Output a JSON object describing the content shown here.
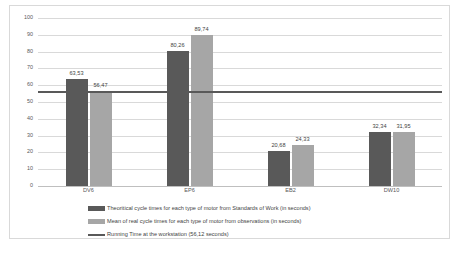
{
  "chart_data": {
    "type": "bar",
    "title": "",
    "xlabel": "",
    "ylabel": "",
    "ylim": [
      0,
      100
    ],
    "ytick_step": 10,
    "yticks": [
      "0",
      "10",
      "20",
      "30",
      "40",
      "50",
      "60",
      "70",
      "80",
      "90",
      "100"
    ],
    "grid": true,
    "legend_position": "bottom",
    "categories": [
      "DV6",
      "EP6",
      "EB2",
      "DW10"
    ],
    "series": [
      {
        "name": "Theoritical cycle times for each type of motor from Standards of Work (in seconds)",
        "color": "#595959",
        "values": [
          63.53,
          80.26,
          20.68,
          32.34
        ],
        "labels": [
          "63,53",
          "80,26",
          "20,68",
          "32,34"
        ]
      },
      {
        "name": "Mean of real cycle times for each type of motor from observations (in seconds)",
        "color": "#a6a6a6",
        "values": [
          56.47,
          89.74,
          24.33,
          31.95
        ],
        "labels": [
          "56,47",
          "89,74",
          "24,33",
          "31,95"
        ]
      }
    ],
    "reference_line": {
      "name": "Running Time at the workstation (56,12 seconds)",
      "color": "#595959",
      "value": 56.12
    }
  },
  "legend": {
    "items": [
      {
        "label": "Theoritical cycle times for each type of motor from Standards of Work (in seconds)"
      },
      {
        "label": "Mean of real cycle times for each type of motor from observations (in seconds)"
      },
      {
        "label": "Running Time at the workstation (56,12 seconds)"
      }
    ]
  }
}
